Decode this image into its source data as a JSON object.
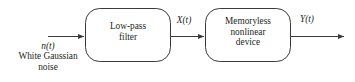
{
  "diagram": {
    "type": "block-diagram",
    "background_color": "#ffffff",
    "stroke_color": "#3b3b3b",
    "text_color": "#231f20",
    "blocks": [
      {
        "id": "low-pass-filter",
        "lines": [
          "Low-pass",
          "filter"
        ],
        "shape": "rounded-rectangle",
        "x": 85,
        "y": 8,
        "width": 86,
        "height": 54,
        "corner_radius": 14
      },
      {
        "id": "memoryless-nonlinear-device",
        "lines": [
          "Memoryless",
          "nonlinear",
          "device"
        ],
        "shape": "rounded-rectangle",
        "x": 205,
        "y": 8,
        "width": 86,
        "height": 54,
        "corner_radius": 14
      }
    ],
    "signals": [
      {
        "id": "input-signal",
        "symbol": "n(t)",
        "symbol_italic": "n",
        "symbol_rest": "(t)",
        "description_lines": [
          "White Gaussian",
          "noise"
        ]
      },
      {
        "id": "intermediate-signal",
        "symbol": "X(t)",
        "symbol_italic": "X",
        "symbol_rest": "(t)"
      },
      {
        "id": "output-signal",
        "symbol": "Y(t)",
        "symbol_italic": "Y",
        "symbol_rest": "(t)"
      }
    ],
    "arrows": [
      {
        "id": "input-arrow",
        "from_x": 48,
        "to_x": 85,
        "y": 37
      },
      {
        "id": "interstage-arrow",
        "from_x": 171,
        "to_x": 205,
        "y": 37
      },
      {
        "id": "output-arrow",
        "from_x": 291,
        "to_x": 345,
        "y": 37
      }
    ]
  }
}
